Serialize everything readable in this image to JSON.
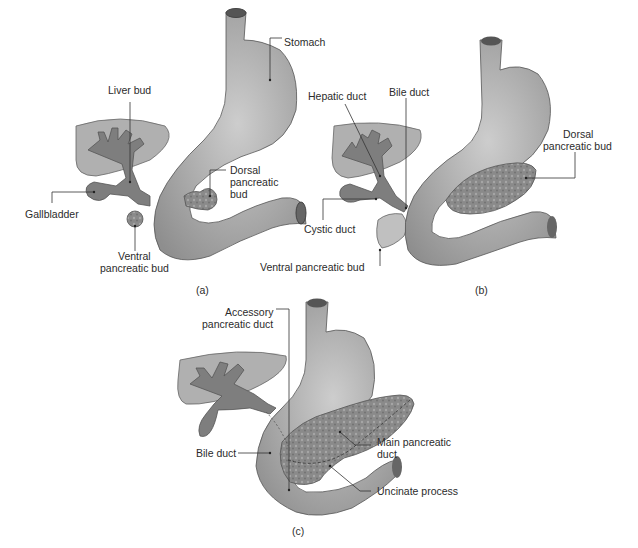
{
  "figure": {
    "panels": [
      {
        "id": "a",
        "caption": "(a)",
        "labels": {
          "stomach": "Stomach",
          "liver_bud": "Liver bud",
          "gallbladder": "Gallbladder",
          "ventral_bud_line1": "Ventral",
          "ventral_bud_line2": "pancreatic bud",
          "dorsal_bud_line1": "Dorsal",
          "dorsal_bud_line2": "pancreatic",
          "dorsal_bud_line3": "bud"
        }
      },
      {
        "id": "b",
        "caption": "(b)",
        "labels": {
          "hepatic_duct": "Hepatic duct",
          "bile_duct": "Bile duct",
          "cystic_duct": "Cystic duct",
          "ventral_bud": "Ventral pancreatic bud",
          "dorsal_bud_line1": "Dorsal",
          "dorsal_bud_line2": "pancreatic bud"
        }
      },
      {
        "id": "c",
        "caption": "(c)",
        "labels": {
          "accessory_duct_line1": "Accessory",
          "accessory_duct_line2": "pancreatic duct",
          "bile_duct": "Bile duct",
          "main_duct_line1": "Main pancreatic",
          "main_duct_line2": "duct",
          "uncinate": "Uncinate process"
        }
      }
    ],
    "colors": {
      "organ_fill": "#9a9a9a",
      "organ_light": "#c4c4c4",
      "liver_fill": "#a8a8a8",
      "duct_fill": "#7a7a7a",
      "pancreas_fill": "#8e8e8e",
      "outline": "#555555"
    }
  }
}
